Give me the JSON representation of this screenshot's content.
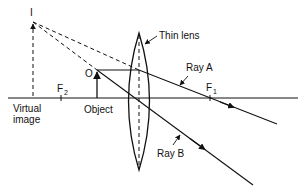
{
  "diagram": {
    "labels": {
      "image_point": "I",
      "object_point": "O",
      "lens": "Thin lens",
      "ray_a": "Ray A",
      "ray_b": "Ray B",
      "focal_1": "F",
      "focal_1_sub": "1",
      "focal_2": "F",
      "focal_2_sub": "2",
      "virtual_image_line1": "Virtual",
      "virtual_image_line2": "image",
      "object": "Object"
    },
    "colors": {
      "stroke": "#111111",
      "background": "#ffffff"
    }
  }
}
